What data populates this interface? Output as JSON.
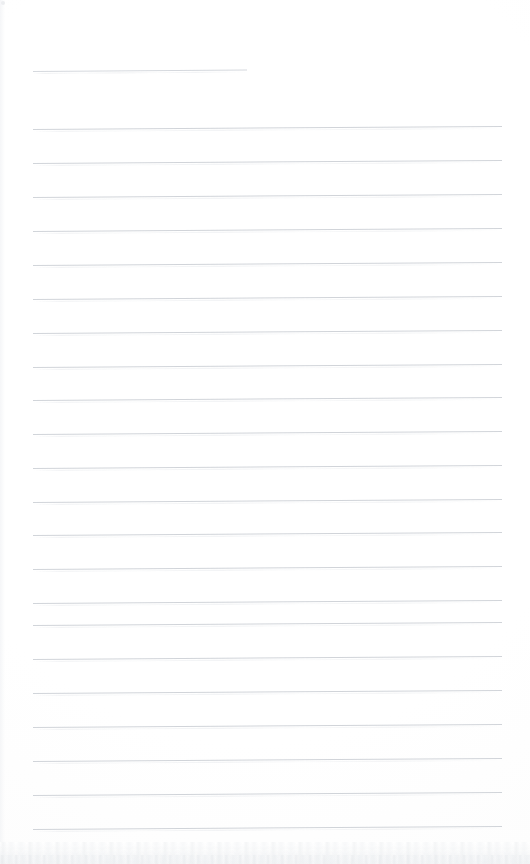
{
  "document": {
    "kind": "scanned-blank-ruled-notepad-page",
    "page_width": 530,
    "page_height": 864,
    "background_color": "#ffffff",
    "rule_color": "#c9cdd3",
    "speck_color": "#eceef0",
    "bottom_texture_color": "#f2f3f5",
    "page_label": "",
    "header_text": "",
    "body_text": "",
    "footer_text": ""
  },
  "ruling": {
    "style": "wide-ruled",
    "line_count": 23,
    "line_spacing_px": 34,
    "left_margin_px": 33,
    "right_margin_px": 502,
    "first_line_y_px": 71,
    "tilt_degrees": -0.37,
    "lines": [
      {
        "index": 1,
        "y": 71,
        "x_start": 33,
        "x_end": 247,
        "type": "partial",
        "text": ""
      },
      {
        "index": 2,
        "y": 129,
        "x_start": 33,
        "x_end": 502,
        "type": "full",
        "text": ""
      },
      {
        "index": 3,
        "y": 163,
        "x_start": 33,
        "x_end": 502,
        "type": "full",
        "text": ""
      },
      {
        "index": 4,
        "y": 197,
        "x_start": 33,
        "x_end": 502,
        "type": "full",
        "text": ""
      },
      {
        "index": 5,
        "y": 231,
        "x_start": 33,
        "x_end": 502,
        "type": "full",
        "text": ""
      },
      {
        "index": 6,
        "y": 265,
        "x_start": 33,
        "x_end": 502,
        "type": "full",
        "text": ""
      },
      {
        "index": 7,
        "y": 299,
        "x_start": 33,
        "x_end": 502,
        "type": "full",
        "text": ""
      },
      {
        "index": 8,
        "y": 333,
        "x_start": 33,
        "x_end": 502,
        "type": "full",
        "text": ""
      },
      {
        "index": 9,
        "y": 367,
        "x_start": 33,
        "x_end": 502,
        "type": "full",
        "text": ""
      },
      {
        "index": 10,
        "y": 400,
        "x_start": 33,
        "x_end": 502,
        "type": "full",
        "text": ""
      },
      {
        "index": 11,
        "y": 434,
        "x_start": 33,
        "x_end": 502,
        "type": "full",
        "text": ""
      },
      {
        "index": 12,
        "y": 468,
        "x_start": 33,
        "x_end": 502,
        "type": "full",
        "text": ""
      },
      {
        "index": 13,
        "y": 502,
        "x_start": 33,
        "x_end": 502,
        "type": "full",
        "text": ""
      },
      {
        "index": 14,
        "y": 535,
        "x_start": 33,
        "x_end": 502,
        "type": "full",
        "text": ""
      },
      {
        "index": 15,
        "y": 569,
        "x_start": 33,
        "x_end": 502,
        "type": "full",
        "text": ""
      },
      {
        "index": 16,
        "y": 603,
        "x_start": 33,
        "x_end": 502,
        "type": "full",
        "text": ""
      },
      {
        "index": 17,
        "y": 625,
        "x_start": 33,
        "x_end": 502,
        "type": "full",
        "text": ""
      },
      {
        "index": 18,
        "y": 659,
        "x_start": 33,
        "x_end": 502,
        "type": "full",
        "text": ""
      },
      {
        "index": 19,
        "y": 693,
        "x_start": 33,
        "x_end": 502,
        "type": "full",
        "text": ""
      },
      {
        "index": 20,
        "y": 727,
        "x_start": 33,
        "x_end": 502,
        "type": "full",
        "text": ""
      },
      {
        "index": 21,
        "y": 761,
        "x_start": 33,
        "x_end": 502,
        "type": "full",
        "text": ""
      },
      {
        "index": 22,
        "y": 795,
        "x_start": 33,
        "x_end": 502,
        "type": "full",
        "text": ""
      },
      {
        "index": 23,
        "y": 829,
        "x_start": 33,
        "x_end": 502,
        "type": "full",
        "text": ""
      }
    ]
  },
  "artifacts": {
    "corner_speck": {
      "x": 1,
      "y": 1,
      "size": 4
    },
    "bottom_edge_texture": {
      "y": 842,
      "height": 22
    },
    "left_edge_shadow": {
      "x": 0,
      "width": 5
    }
  }
}
